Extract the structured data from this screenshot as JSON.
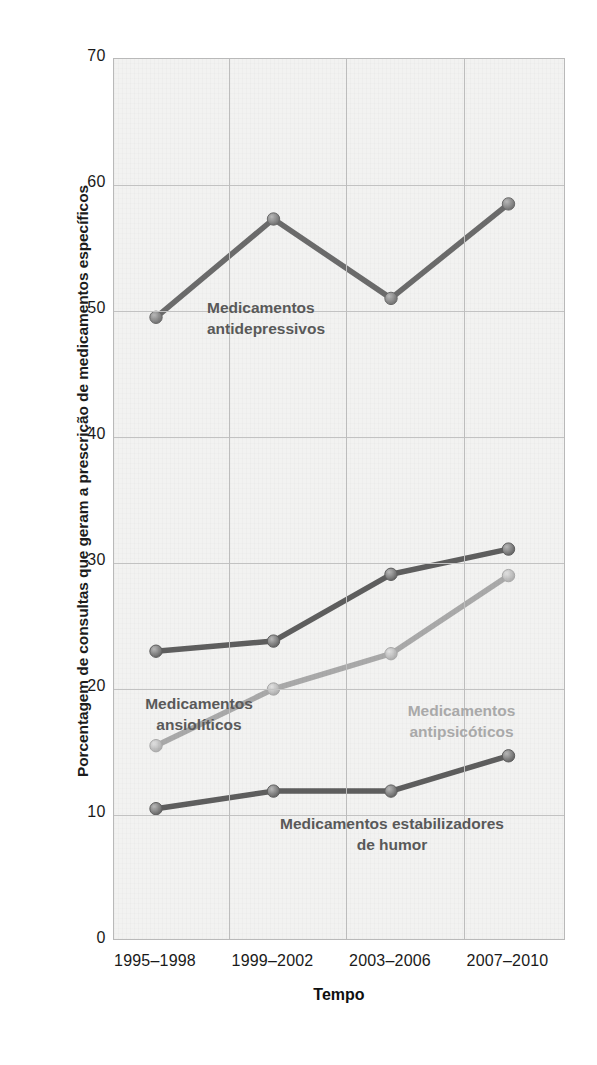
{
  "chart_data": {
    "type": "line",
    "title": "",
    "xlabel": "Tempo",
    "ylabel": "Porcentagem de consultas que geram a prescrição de medicamentos específicos",
    "categories": [
      "1995–1998",
      "1999–2002",
      "2003–2006",
      "2007–2010"
    ],
    "ylim": [
      0,
      70
    ],
    "yticks": [
      0,
      10,
      20,
      30,
      40,
      50,
      60,
      70
    ],
    "ytick_labels": [
      "0",
      "10",
      "20",
      "30",
      "40",
      "50",
      "60",
      "70"
    ],
    "grid": true,
    "legend_position": "inline-annotations",
    "series": [
      {
        "name": "Medicamentos antidepressivos",
        "label_lines": "Medicamentos\nantidepressivos",
        "color": "#6b6b6b",
        "values": [
          49.5,
          57.3,
          51.0,
          58.5
        ]
      },
      {
        "name": "Medicamentos ansiolíticos",
        "label_lines": "Medicamentos\nansiolíticos",
        "color": "#5e5e5e",
        "values": [
          23.0,
          23.8,
          29.1,
          31.1
        ]
      },
      {
        "name": "Medicamentos antipsicóticos",
        "label_lines": "Medicamentos\nantipsicóticos",
        "color": "#a9a9a9",
        "values": [
          15.5,
          20.0,
          22.8,
          29.0
        ]
      },
      {
        "name": "Medicamentos estabilizadores de humor",
        "label_lines": "Medicamentos estabilizadores\nde humor",
        "color": "#5e5e5e",
        "values": [
          10.5,
          11.9,
          11.9,
          14.7
        ]
      }
    ]
  },
  "axes": {
    "y_title": "Porcentagem de consultas que geram a prescrição de medicamentos específicos",
    "x_title": "Tempo"
  },
  "annotations": [
    {
      "id": "antidepressivos",
      "text": "Medicamentos\nantidepressivos",
      "tone": "dark"
    },
    {
      "id": "ansioliticos",
      "text": "Medicamentos\nansiolíticos",
      "tone": "dark"
    },
    {
      "id": "antipsicoticos",
      "text": "Medicamentos\nantipsicóticos",
      "tone": "light"
    },
    {
      "id": "estabilizadores",
      "text": "Medicamentos estabilizadores\nde humor",
      "tone": "dark"
    }
  ]
}
